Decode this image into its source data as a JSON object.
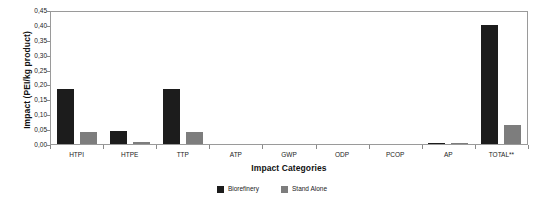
{
  "chart_data": {
    "type": "bar",
    "title": "",
    "xlabel": "Impact Categories",
    "ylabel": "Impact (PEI/kg product)",
    "categories": [
      "HTPI",
      "HTPE",
      "TTP",
      "ATP",
      "GWP",
      "ODP",
      "PCOP",
      "AP",
      "TOTAL**"
    ],
    "series": [
      {
        "name": "Biorefinery",
        "color": "#1c1c1c",
        "values": [
          0.185,
          0.045,
          0.185,
          0.0,
          0.0,
          0.0,
          0.0,
          0.004,
          0.4
        ]
      },
      {
        "name": "Stand Alone",
        "color": "#7d7d7d",
        "values": [
          0.04,
          0.008,
          0.04,
          0.0,
          0.0,
          0.0,
          0.0,
          0.001,
          0.065
        ]
      }
    ],
    "ylim": [
      0.0,
      0.45
    ],
    "yticks": [
      0.0,
      0.05,
      0.1,
      0.15,
      0.2,
      0.25,
      0.3,
      0.35,
      0.4,
      0.45
    ],
    "ytick_labels": [
      "0,00",
      "0,05",
      "0,10",
      "0,15",
      "0,20",
      "0,25",
      "0,30",
      "0,35",
      "0,40",
      "0,45"
    ],
    "grid": false,
    "legend_position": "bottom-center"
  },
  "legend": {
    "items": [
      {
        "label": "Biorefinery",
        "color": "#1c1c1c"
      },
      {
        "label": "Stand Alone",
        "color": "#7d7d7d"
      }
    ]
  }
}
